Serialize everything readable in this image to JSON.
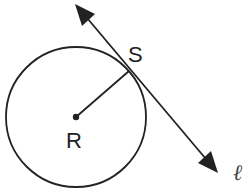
{
  "diagram": {
    "circle": {
      "center_label": "R",
      "cx": 76,
      "cy": 117,
      "r": 70
    },
    "tangent_point": {
      "label": "S",
      "x": 129,
      "y": 71
    },
    "line": {
      "label": "ℓ",
      "x1": 77,
      "y1": 5,
      "x2": 217,
      "y2": 172
    },
    "stroke_color": "#222222"
  }
}
